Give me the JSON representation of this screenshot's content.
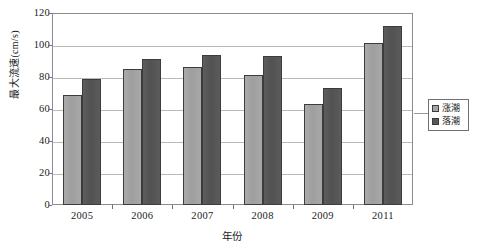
{
  "chart_data": {
    "type": "bar",
    "title": "",
    "xlabel": "年份",
    "ylabel": "最大流速(cm/s)",
    "categories": [
      "2005",
      "2006",
      "2007",
      "2008",
      "2009",
      "2011"
    ],
    "series": [
      {
        "name": "涨潮",
        "color": "#a5a5a5",
        "values": [
          69,
          85,
          86,
          81,
          63,
          101
        ]
      },
      {
        "name": "落潮",
        "color": "#575757",
        "values": [
          79,
          91,
          94,
          93,
          73,
          112
        ]
      }
    ],
    "ylim": [
      0,
      120
    ],
    "ytick_labels": [
      "120",
      "100",
      "80",
      "60",
      "40",
      "20",
      "0"
    ],
    "ytick_values": [
      120,
      100,
      80,
      60,
      40,
      20,
      0
    ],
    "ystep": 20,
    "grid": "horizontal",
    "legend_position": "right"
  }
}
